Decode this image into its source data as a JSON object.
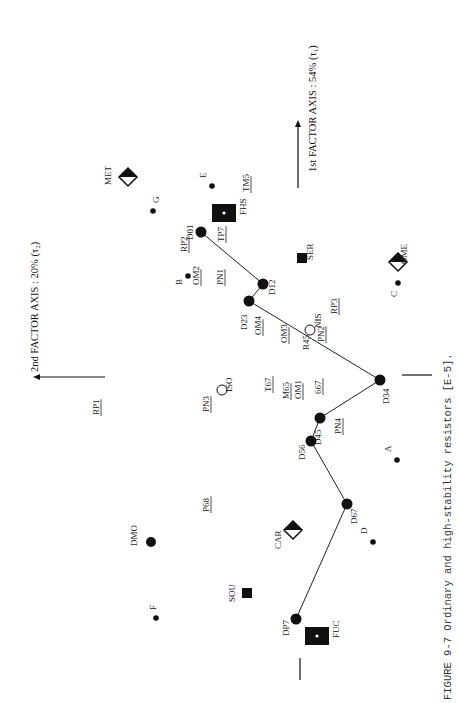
{
  "figure": {
    "caption": "FIGURE 9-7  Ordinary and high-stability resistors [E-5].",
    "axis1_label": "1st FACTOR AXIS : 54%  (τ₁)",
    "axis2_label": "2nd FACTOR AXIS : 20%  (τ₂)"
  },
  "path": {
    "label": "trajectory D01→DP7",
    "nodes": [
      {
        "id": "D01",
        "x": 201,
        "y": 232,
        "lx": 190,
        "ly": 232
      },
      {
        "id": "D12",
        "x": 263,
        "y": 284,
        "lx": 272,
        "ly": 287
      },
      {
        "id": "D23",
        "x": 249,
        "y": 301,
        "lx": 244,
        "ly": 322
      },
      {
        "id": "D34",
        "x": 380,
        "y": 380,
        "lx": 386,
        "ly": 396
      },
      {
        "id": "D45",
        "x": 320,
        "y": 418,
        "lx": 318,
        "ly": 437
      },
      {
        "id": "D56",
        "x": 311,
        "y": 441,
        "lx": 302,
        "ly": 452
      },
      {
        "id": "D67",
        "x": 347,
        "y": 504,
        "lx": 354,
        "ly": 516
      },
      {
        "id": "DP7",
        "x": 296,
        "y": 619,
        "lx": 286,
        "ly": 628
      }
    ]
  },
  "markers": [
    {
      "id": "MET",
      "shape": "half-diamond",
      "x": 128,
      "y": 177,
      "lx": 112,
      "ly": 183
    },
    {
      "id": "OME",
      "shape": "half-diamond",
      "x": 398,
      "y": 262,
      "lx": 408,
      "ly": 262
    },
    {
      "id": "CAR",
      "shape": "half-diamond",
      "x": 293,
      "y": 530,
      "lx": 282,
      "ly": 547
    },
    {
      "id": "FHS",
      "shape": "square-dot",
      "x": 224,
      "y": 213,
      "lx": 247,
      "ly": 213
    },
    {
      "id": "FUC",
      "shape": "square-dot",
      "x": 317,
      "y": 636,
      "lx": 340,
      "ly": 636
    },
    {
      "id": "SER",
      "shape": "square",
      "x": 302,
      "y": 258,
      "lx": 314,
      "ly": 258
    },
    {
      "id": "SOU",
      "shape": "square",
      "x": 247,
      "y": 593,
      "lx": 236,
      "ly": 600
    },
    {
      "id": "NIS",
      "shape": "open-circle",
      "x": 310,
      "y": 330,
      "lx": 322,
      "ly": 326
    },
    {
      "id": "ISO",
      "shape": "open-circle",
      "x": 222,
      "y": 390,
      "lx": 233,
      "ly": 390
    },
    {
      "id": "DMO",
      "shape": "big-dot",
      "x": 151,
      "y": 542,
      "lx": 138,
      "ly": 544
    },
    {
      "id": "A",
      "shape": "dot",
      "x": 397,
      "y": 460,
      "lx": 392,
      "ly": 450
    },
    {
      "id": "B",
      "shape": "dot",
      "x": 188,
      "y": 276,
      "lx": 183,
      "ly": 283
    },
    {
      "id": "C",
      "shape": "dot",
      "x": 398,
      "y": 283,
      "lx": 398,
      "ly": 295
    },
    {
      "id": "D",
      "shape": "dot",
      "x": 373,
      "y": 542,
      "lx": 368,
      "ly": 532
    },
    {
      "id": "E",
      "shape": "dot",
      "x": 212,
      "y": 186,
      "lx": 207,
      "ly": 176
    },
    {
      "id": "F",
      "shape": "dot",
      "x": 156,
      "y": 618,
      "lx": 157,
      "ly": 608
    },
    {
      "id": "G",
      "shape": "dot",
      "x": 153,
      "y": 211,
      "lx": 160,
      "ly": 201
    }
  ],
  "underlined_labels": [
    {
      "id": "TM5",
      "x": 250,
      "y": 190
    },
    {
      "id": "TP7",
      "x": 225,
      "y": 240
    },
    {
      "id": "RP2",
      "x": 188,
      "y": 250
    },
    {
      "id": "OM2",
      "x": 200,
      "y": 283
    },
    {
      "id": "PN1",
      "x": 224,
      "y": 283
    },
    {
      "id": "OM4",
      "x": 262,
      "y": 333
    },
    {
      "id": "OM3",
      "x": 288,
      "y": 341
    },
    {
      "id": "PN2",
      "x": 325,
      "y": 340
    },
    {
      "id": "RP3",
      "x": 338,
      "y": 312
    },
    {
      "id": "T67",
      "x": 272,
      "y": 390
    },
    {
      "id": "M65",
      "x": 290,
      "y": 397
    },
    {
      "id": "OM1",
      "x": 302,
      "y": 397
    },
    {
      "id": "667",
      "x": 322,
      "y": 392
    },
    {
      "id": "PN3",
      "x": 210,
      "y": 410
    },
    {
      "id": "RP1",
      "x": 100,
      "y": 413
    },
    {
      "id": "PN4",
      "x": 342,
      "y": 432
    },
    {
      "id": "P68",
      "x": 210,
      "y": 510
    }
  ],
  "extra_labels": [
    {
      "id": "R45",
      "text": "R45",
      "x": 310,
      "y": 348
    }
  ]
}
